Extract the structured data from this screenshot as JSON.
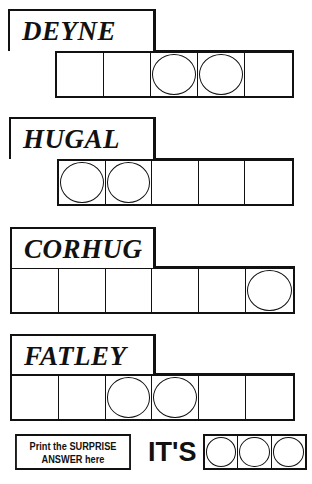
{
  "puzzles": [
    {
      "scrambled": "DEYNE",
      "cells": 5,
      "circled": [
        2,
        3
      ],
      "label": {
        "x": 8,
        "y": 9,
        "w": 148,
        "h": 42
      },
      "grid": {
        "x": 55,
        "y": 50,
        "w": 239,
        "h": 48
      }
    },
    {
      "scrambled": "HUGAL",
      "cells": 5,
      "circled": [
        0,
        1
      ],
      "label": {
        "x": 9,
        "y": 117,
        "w": 147,
        "h": 42
      },
      "grid": {
        "x": 57,
        "y": 158,
        "w": 237,
        "h": 48
      }
    },
    {
      "scrambled": "CORHUG",
      "cells": 6,
      "circled": [
        5
      ],
      "label": {
        "x": 10,
        "y": 227,
        "w": 146,
        "h": 41
      },
      "grid": {
        "x": 10,
        "y": 266,
        "w": 285,
        "h": 48
      }
    },
    {
      "scrambled": "FATLEY",
      "cells": 6,
      "circled": [
        2,
        3
      ],
      "label": {
        "x": 10,
        "y": 334,
        "w": 146,
        "h": 40
      },
      "grid": {
        "x": 10,
        "y": 373,
        "w": 285,
        "h": 48
      }
    }
  ],
  "surprise": {
    "instruction_line1": "Print the SURPRISE",
    "instruction_line2": "ANSWER here",
    "prefix": "IT'S",
    "answer_cells": 3
  }
}
